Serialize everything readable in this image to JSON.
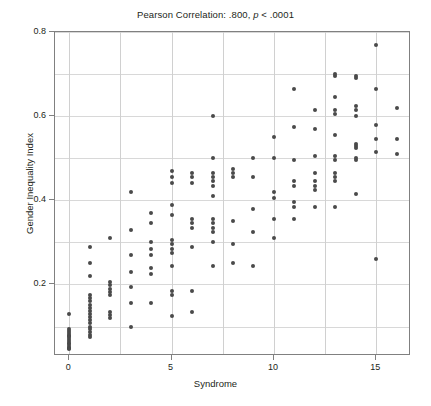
{
  "chart_data": {
    "type": "scatter",
    "title": "Pearson Correlation: .800, p < .0001",
    "title_plain": "Pearson Correlation: .800, ",
    "title_italic": "p",
    "title_tail": " < .0001",
    "xlabel": "Syndrome",
    "ylabel": "Gender Inequality Index",
    "xlim": [
      -0.7,
      16.7
    ],
    "ylim": [
      0.03,
      0.8
    ],
    "xticks": [
      0,
      5,
      10,
      15
    ],
    "xtick_labels": [
      "0",
      "5",
      "10",
      "15"
    ],
    "yticks": [
      0.2,
      0.4,
      0.6,
      0.8
    ],
    "ytick_labels": [
      "0.2",
      "0.4",
      "0.6",
      "0.8"
    ],
    "x_minor_gridlines": [
      2.5,
      7.5,
      12.5
    ],
    "y_minor_gridlines": [
      0.1,
      0.3,
      0.5,
      0.7
    ],
    "grid": true,
    "legend": "none",
    "marker_color": "#4a4a4a",
    "marker_size": 4,
    "statistics": {
      "pearson_r": 0.8,
      "p_value_text": "< .0001"
    },
    "points": [
      [
        0,
        0.13
      ],
      [
        0,
        0.095
      ],
      [
        0,
        0.09
      ],
      [
        0,
        0.085
      ],
      [
        0,
        0.08
      ],
      [
        0,
        0.078
      ],
      [
        0,
        0.074
      ],
      [
        0,
        0.07
      ],
      [
        0,
        0.066
      ],
      [
        0,
        0.062
      ],
      [
        0,
        0.058
      ],
      [
        0,
        0.054
      ],
      [
        0,
        0.05
      ],
      [
        0,
        0.048
      ],
      [
        0,
        0.046
      ],
      [
        1,
        0.29
      ],
      [
        1,
        0.25
      ],
      [
        1,
        0.22
      ],
      [
        1,
        0.175
      ],
      [
        1,
        0.168
      ],
      [
        1,
        0.16
      ],
      [
        1,
        0.152
      ],
      [
        1,
        0.145
      ],
      [
        1,
        0.138
      ],
      [
        1,
        0.13
      ],
      [
        1,
        0.122
      ],
      [
        1,
        0.115
      ],
      [
        1,
        0.108
      ],
      [
        1,
        0.1
      ],
      [
        1,
        0.093
      ],
      [
        1,
        0.086
      ],
      [
        1,
        0.08
      ],
      [
        1,
        0.074
      ],
      [
        2,
        0.31
      ],
      [
        2,
        0.205
      ],
      [
        2,
        0.198
      ],
      [
        2,
        0.19
      ],
      [
        2,
        0.182
      ],
      [
        2,
        0.175
      ],
      [
        2,
        0.135
      ],
      [
        2,
        0.128
      ],
      [
        2,
        0.12
      ],
      [
        3,
        0.42
      ],
      [
        3,
        0.33
      ],
      [
        3,
        0.27
      ],
      [
        3,
        0.23
      ],
      [
        3,
        0.195
      ],
      [
        3,
        0.155
      ],
      [
        3,
        0.1
      ],
      [
        4,
        0.37
      ],
      [
        4,
        0.345
      ],
      [
        4,
        0.3
      ],
      [
        4,
        0.285
      ],
      [
        4,
        0.27
      ],
      [
        4,
        0.24
      ],
      [
        4,
        0.225
      ],
      [
        4,
        0.155
      ],
      [
        5,
        0.47
      ],
      [
        5,
        0.455
      ],
      [
        5,
        0.44
      ],
      [
        5,
        0.39
      ],
      [
        5,
        0.365
      ],
      [
        5,
        0.305
      ],
      [
        5,
        0.295
      ],
      [
        5,
        0.285
      ],
      [
        5,
        0.275
      ],
      [
        5,
        0.245
      ],
      [
        5,
        0.185
      ],
      [
        5,
        0.175
      ],
      [
        5,
        0.125
      ],
      [
        6,
        0.465
      ],
      [
        6,
        0.455
      ],
      [
        6,
        0.44
      ],
      [
        6,
        0.355
      ],
      [
        6,
        0.345
      ],
      [
        6,
        0.335
      ],
      [
        6,
        0.29
      ],
      [
        6,
        0.185
      ],
      [
        6,
        0.135
      ],
      [
        7,
        0.6
      ],
      [
        7,
        0.5
      ],
      [
        7,
        0.465
      ],
      [
        7,
        0.455
      ],
      [
        7,
        0.445
      ],
      [
        7,
        0.435
      ],
      [
        7,
        0.41
      ],
      [
        7,
        0.355
      ],
      [
        7,
        0.345
      ],
      [
        7,
        0.335
      ],
      [
        7,
        0.325
      ],
      [
        7,
        0.3
      ],
      [
        7,
        0.245
      ],
      [
        8,
        0.475
      ],
      [
        8,
        0.465
      ],
      [
        8,
        0.455
      ],
      [
        8,
        0.35
      ],
      [
        8,
        0.295
      ],
      [
        8,
        0.25
      ],
      [
        9,
        0.5
      ],
      [
        9,
        0.455
      ],
      [
        9,
        0.38
      ],
      [
        9,
        0.325
      ],
      [
        9,
        0.245
      ],
      [
        10,
        0.55
      ],
      [
        10,
        0.5
      ],
      [
        10,
        0.42
      ],
      [
        10,
        0.405
      ],
      [
        10,
        0.355
      ],
      [
        10,
        0.31
      ],
      [
        11,
        0.665
      ],
      [
        11,
        0.575
      ],
      [
        11,
        0.495
      ],
      [
        11,
        0.445
      ],
      [
        11,
        0.435
      ],
      [
        11,
        0.395
      ],
      [
        11,
        0.385
      ],
      [
        11,
        0.355
      ],
      [
        12,
        0.615
      ],
      [
        12,
        0.57
      ],
      [
        12,
        0.505
      ],
      [
        12,
        0.465
      ],
      [
        12,
        0.445
      ],
      [
        12,
        0.435
      ],
      [
        12,
        0.425
      ],
      [
        12,
        0.385
      ],
      [
        13,
        0.7
      ],
      [
        13,
        0.695
      ],
      [
        13,
        0.645
      ],
      [
        13,
        0.615
      ],
      [
        13,
        0.605
      ],
      [
        13,
        0.555
      ],
      [
        13,
        0.505
      ],
      [
        13,
        0.495
      ],
      [
        13,
        0.465
      ],
      [
        13,
        0.455
      ],
      [
        13,
        0.445
      ],
      [
        13,
        0.385
      ],
      [
        14,
        0.695
      ],
      [
        14,
        0.69
      ],
      [
        14,
        0.625
      ],
      [
        14,
        0.615
      ],
      [
        14,
        0.6
      ],
      [
        14,
        0.535
      ],
      [
        14,
        0.53
      ],
      [
        14,
        0.525
      ],
      [
        14,
        0.5
      ],
      [
        14,
        0.495
      ],
      [
        14,
        0.415
      ],
      [
        15,
        0.77
      ],
      [
        15,
        0.665
      ],
      [
        15,
        0.58
      ],
      [
        15,
        0.545
      ],
      [
        15,
        0.515
      ],
      [
        15,
        0.26
      ],
      [
        16,
        0.62
      ],
      [
        16,
        0.545
      ],
      [
        16,
        0.51
      ]
    ]
  }
}
